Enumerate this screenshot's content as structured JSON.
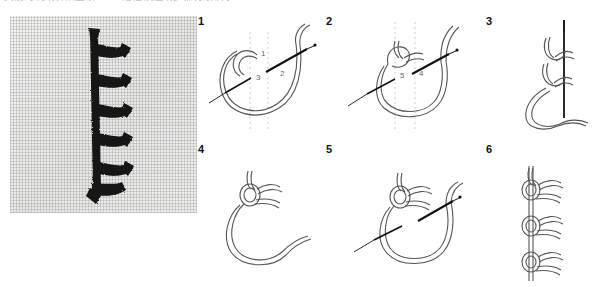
{
  "header": {
    "caption": "美丽的刺绣针法图解 —— 结粒锁边绣步骤分解演示"
  },
  "photo": {
    "name": "embroidered-stitch-sample",
    "alt": "Photograph of a worked knotted feather stitch line in dark thread on pale woven linen fabric",
    "fabric_color": "#ededec",
    "thread_color": "#141414",
    "stitch_count": 6
  },
  "diagrams": {
    "thread_color": "#4a4a4a",
    "needle_color": "#111111",
    "guide_color": "#cfcfcf",
    "panels": [
      {
        "number": "1",
        "name": "step-1-loop-and-entry-points",
        "labels": [
          {
            "text": "1",
            "x": 66,
            "y": 42
          },
          {
            "text": "2",
            "x": 85,
            "y": 62
          },
          {
            "text": "3",
            "x": 61,
            "y": 65
          }
        ],
        "guides": 2,
        "has_needle": true
      },
      {
        "number": "2",
        "name": "step-2-needle-through-loop",
        "labels": [
          {
            "text": "5",
            "x": 81,
            "y": 62
          },
          {
            "text": "4",
            "x": 100,
            "y": 60
          }
        ],
        "guides": 2,
        "has_needle": true
      },
      {
        "number": "3",
        "name": "step-3-tighten-knot-on-needle",
        "labels": [],
        "guides": 0,
        "has_needle": true
      },
      {
        "number": "4",
        "name": "step-4-completed-knot",
        "labels": [],
        "guides": 0,
        "has_needle": false
      },
      {
        "number": "5",
        "name": "step-5-begin-next-stitch",
        "labels": [],
        "guides": 0,
        "has_needle": true
      },
      {
        "number": "6",
        "name": "step-6-repeated-knot-chain",
        "labels": [],
        "guides": 0,
        "has_needle": false
      }
    ]
  }
}
